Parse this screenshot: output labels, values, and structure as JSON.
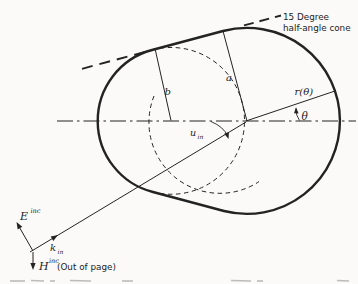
{
  "figure": {
    "background_color": "#fbfaf8",
    "ink_color": "#232323",
    "annotations": {
      "cone_label_line1": "15 Degree",
      "cone_label_line2": "half-angle cone",
      "dim_a": "a",
      "dim_b": "b",
      "radial_label": "r(θ)",
      "theta_label": "θ",
      "u_base": "u",
      "u_sub": "in",
      "E_base": "E",
      "E_sup": "inc",
      "k_base": "k",
      "k_sub": "in",
      "H_base": "H",
      "H_sup": "inc",
      "H_note": "(Out of page)"
    }
  }
}
